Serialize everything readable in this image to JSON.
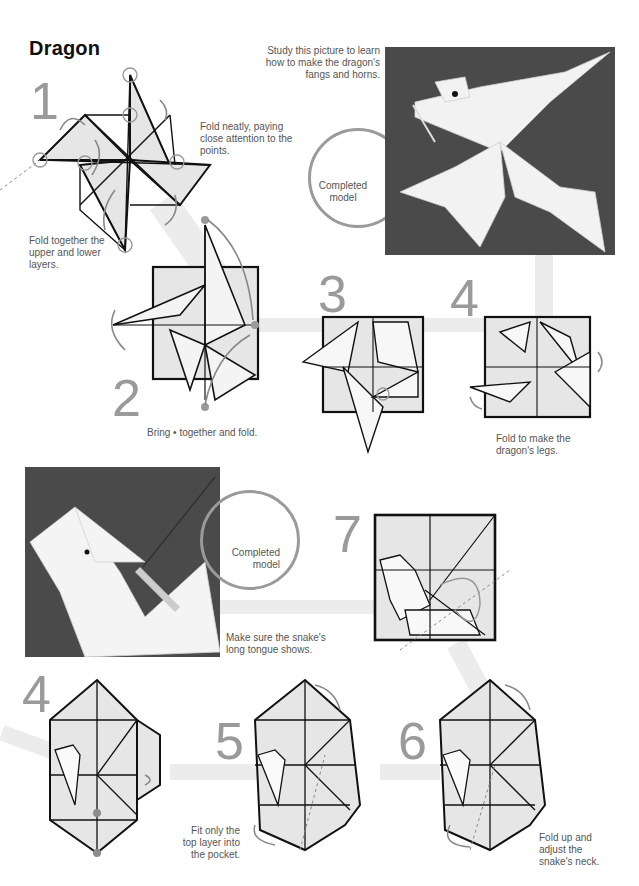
{
  "page": {
    "title": "Dragon"
  },
  "dragon": {
    "steps": [
      {
        "number": "1",
        "notes": [
          "Fold neatly, paying close attention to the points.",
          "Fold together the upper and lower layers."
        ]
      },
      {
        "number": "2",
        "notes": [
          "Bring • together and fold."
        ]
      },
      {
        "number": "3",
        "notes": []
      },
      {
        "number": "4",
        "notes": [
          "Fold to make the dragon's legs."
        ]
      }
    ],
    "photo_caption": "Study this picture to learn how to make the dragon's fangs and horns.",
    "completed_label": "Completed model"
  },
  "snake": {
    "steps": [
      {
        "number": "4",
        "notes": []
      },
      {
        "number": "5",
        "notes": [
          "Fit only the top layer into the pocket."
        ]
      },
      {
        "number": "6",
        "notes": [
          "Fold up and adjust the snake's neck."
        ]
      },
      {
        "number": "7",
        "notes": []
      }
    ],
    "photo_caption": "Make sure the snake's long tongue shows.",
    "completed_label": "Completed model"
  },
  "colors": {
    "step_number": "#9a9a9a",
    "photo_background": "#4a4a4a",
    "paper_fill": "#e6e6e6",
    "path_band": "#ececec",
    "marker_dot": "#8c8c8c"
  }
}
